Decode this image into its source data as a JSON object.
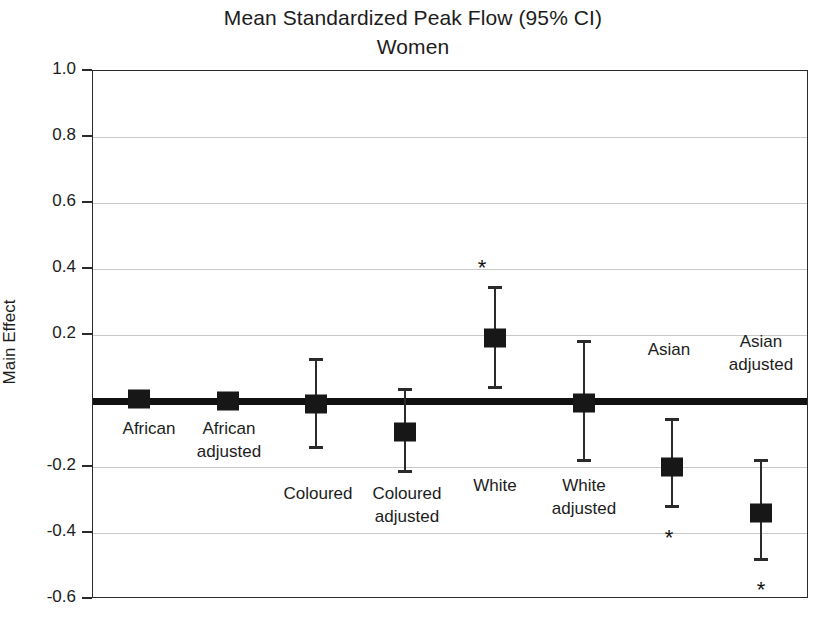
{
  "chart_data": {
    "type": "scatter",
    "title": "Mean Standardized Peak Flow (95% CI)",
    "subtitle": "Women",
    "xlabel": "",
    "ylabel": "Main Effect",
    "ylim": [
      -0.6,
      1.0
    ],
    "yticks": [
      "1.0",
      "0.8",
      "0.6",
      "0.4",
      "0.2",
      "-0.2",
      "-0.4",
      "-0.6"
    ],
    "ytick_values": [
      1.0,
      0.8,
      0.6,
      0.4,
      0.2,
      -0.2,
      -0.4,
      -0.6
    ],
    "grid": true,
    "legend": "none",
    "zero_reference_line": 0.0,
    "annotation_symbol": "*",
    "annotation_meaning": "statistically significant",
    "categories": [
      "African",
      "African adjusted",
      "Coloured",
      "Coloured adjusted",
      "White",
      "White adjusted",
      "Asian",
      "Asian adjusted"
    ],
    "points": [
      {
        "label": "African",
        "label_lines": [
          "African"
        ],
        "value": 0.005,
        "ci_low": 0.005,
        "ci_high": 0.005,
        "significant": false
      },
      {
        "label": "African adjusted",
        "label_lines": [
          "African",
          "adjusted"
        ],
        "value": 0.0,
        "ci_low": 0.0,
        "ci_high": 0.0,
        "significant": false
      },
      {
        "label": "Coloured",
        "label_lines": [
          "Coloured"
        ],
        "value": -0.01,
        "ci_low": -0.14,
        "ci_high": 0.125,
        "significant": false
      },
      {
        "label": "Coloured adjusted",
        "label_lines": [
          "Coloured",
          "adjusted"
        ],
        "value": -0.095,
        "ci_low": -0.215,
        "ci_high": 0.035,
        "significant": false
      },
      {
        "label": "White",
        "label_lines": [
          "White"
        ],
        "value": 0.19,
        "ci_low": 0.04,
        "ci_high": 0.345,
        "significant": true
      },
      {
        "label": "White adjusted",
        "label_lines": [
          "White",
          "adjusted"
        ],
        "value": -0.005,
        "ci_low": -0.18,
        "ci_high": 0.18,
        "significant": false
      },
      {
        "label": "Asian",
        "label_lines": [
          "Asian"
        ],
        "value": -0.2,
        "ci_low": -0.32,
        "ci_high": -0.055,
        "significant": true
      },
      {
        "label": "Asian adjusted",
        "label_lines": [
          "Asian",
          "adjusted"
        ],
        "value": -0.34,
        "ci_low": -0.48,
        "ci_high": -0.18,
        "significant": true
      }
    ],
    "colors": {
      "marker": "#171717",
      "errorbar": "#2b2b2b",
      "zero_line": "#111111",
      "gridline": "#c9c9c9",
      "axis": "#2a2a2a",
      "text": "#1c1c1c",
      "background": "#ffffff"
    }
  },
  "layout": {
    "label_positions": [
      {
        "x": 148,
        "y": 416
      },
      {
        "x": 228,
        "y": 416
      },
      {
        "x": 317,
        "y": 481
      },
      {
        "x": 406,
        "y": 481
      },
      {
        "x": 494,
        "y": 473
      },
      {
        "x": 583,
        "y": 473
      },
      {
        "x": 668,
        "y": 337
      },
      {
        "x": 760,
        "y": 329
      }
    ],
    "star_positions": [
      null,
      null,
      null,
      null,
      {
        "x": 481,
        "y": 267
      },
      null,
      {
        "x": 668,
        "y": 537
      },
      {
        "x": 760,
        "y": 589
      }
    ],
    "point_x": [
      138,
      227,
      315,
      404,
      494,
      583,
      671,
      760
    ]
  }
}
